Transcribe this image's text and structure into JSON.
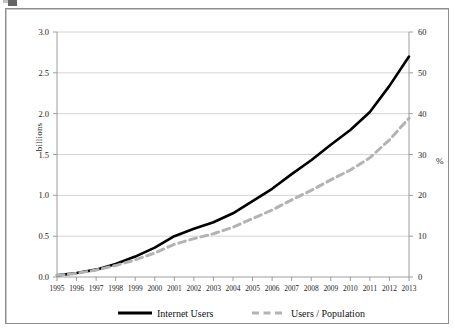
{
  "figure": {
    "background_color": "#ffffff",
    "frame_color": "#8e8e8e",
    "axis_color": "#9d9d9d",
    "gridline_color": "#d4d4d4"
  },
  "chart_data": {
    "type": "line",
    "title": "",
    "xlabel": "",
    "ylabel": "billions",
    "y2label": "%",
    "x": [
      1995,
      1996,
      1997,
      1998,
      1999,
      2000,
      2001,
      2002,
      2003,
      2004,
      2005,
      2006,
      2007,
      2008,
      2009,
      2010,
      2011,
      2012,
      2013
    ],
    "categories": [
      "1995",
      "1996",
      "1997",
      "1998",
      "1999",
      "2000",
      "2001",
      "2002",
      "2003",
      "2004",
      "2005",
      "2006",
      "2007",
      "2008",
      "2009",
      "2010",
      "2011",
      "2012",
      "2013"
    ],
    "ylim": [
      0.0,
      3.0
    ],
    "y2lim": [
      0,
      60
    ],
    "yticks": [
      "0.0",
      "0.5",
      "1.0",
      "1.5",
      "2.0",
      "2.5",
      "3.0"
    ],
    "ytick_values": [
      0.0,
      0.5,
      1.0,
      1.5,
      2.0,
      2.5,
      3.0
    ],
    "y2ticks": [
      "0",
      "10",
      "20",
      "30",
      "40",
      "50",
      "60"
    ],
    "y2tick_values": [
      0,
      10,
      20,
      30,
      40,
      50,
      60
    ],
    "grid": true,
    "grid_axis": "y",
    "legend_position": "bottom",
    "series": [
      {
        "name": "Internet Users",
        "axis": "left",
        "unit": "billions",
        "style": "solid",
        "color": "#000000",
        "width": 2.6,
        "values": [
          0.02,
          0.05,
          0.09,
          0.16,
          0.25,
          0.36,
          0.5,
          0.59,
          0.67,
          0.78,
          0.93,
          1.08,
          1.26,
          1.43,
          1.62,
          1.8,
          2.02,
          2.34,
          2.7
        ]
      },
      {
        "name": "Users / Population",
        "axis": "right",
        "unit": "%",
        "style": "dashed",
        "color": "#b3b3b3",
        "width": 3.0,
        "values": [
          0.4,
          0.9,
          1.7,
          2.8,
          4.2,
          5.9,
          8.0,
          9.4,
          10.6,
          12.2,
          14.3,
          16.4,
          18.9,
          21.2,
          23.8,
          26.2,
          29.2,
          33.6,
          38.9
        ]
      }
    ],
    "legend": [
      {
        "label": "Internet Users",
        "style": "solid",
        "color": "#000000"
      },
      {
        "label": "Users / Population",
        "style": "dashed",
        "color": "#b3b3b3"
      }
    ]
  }
}
